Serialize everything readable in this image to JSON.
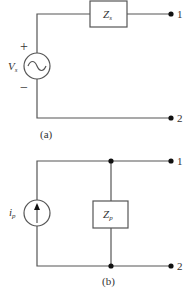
{
  "figure_a": {
    "caption": "(a)",
    "source": {
      "type": "voltage",
      "symbol": "V",
      "subscript": "s",
      "plus": "+",
      "minus": "−",
      "glyph": "sine-wave"
    },
    "impedance": {
      "symbol": "Z",
      "subscript": "s",
      "connection": "series"
    },
    "terminals": [
      "1",
      "2"
    ]
  },
  "figure_b": {
    "caption": "(b)",
    "source": {
      "type": "current",
      "symbol": "i",
      "subscript": "p",
      "glyph": "up-arrow"
    },
    "impedance": {
      "symbol": "Z",
      "subscript": "p",
      "connection": "parallel"
    },
    "terminals": [
      "1",
      "2"
    ]
  },
  "colors": {
    "wire": "#555555",
    "node": "#111111",
    "text": "#333333"
  }
}
